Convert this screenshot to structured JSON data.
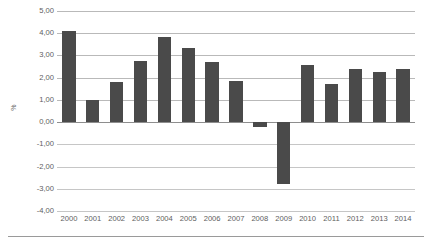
{
  "chart_data": {
    "type": "bar",
    "title": "",
    "subtitle": "",
    "xlabel": "",
    "ylabel": "%",
    "categories": [
      "2000",
      "2001",
      "2002",
      "2003",
      "2004",
      "2005",
      "2006",
      "2007",
      "2008",
      "2009",
      "2010",
      "2011",
      "2012",
      "2013",
      "2014"
    ],
    "values": [
      4.1,
      1.0,
      1.8,
      2.75,
      3.85,
      3.35,
      2.7,
      1.85,
      -0.2,
      -2.8,
      2.55,
      1.7,
      2.4,
      2.25,
      2.4
    ],
    "ylim": [
      -4.0,
      5.0
    ],
    "ytick_step": 1.0,
    "ytick_labels": [
      "5,00",
      "4,00",
      "3,00",
      "2,00",
      "1,00",
      "0,00",
      "-1,00",
      "-2,00",
      "-3,00",
      "-4,00"
    ],
    "ytick_values": [
      5,
      4,
      3,
      2,
      1,
      0,
      -1,
      -2,
      -3,
      -4
    ],
    "grid": true,
    "legend": false,
    "legend_position": "none",
    "decimal_separator": ",",
    "colors": {
      "bar": "#4a4a4a",
      "gridline": "#b9b9b9",
      "zero_axis": "#8e8e8e",
      "text": "#5e5e5e",
      "background": "#ffffff",
      "bottom_rule": "#9a9a9a"
    }
  }
}
